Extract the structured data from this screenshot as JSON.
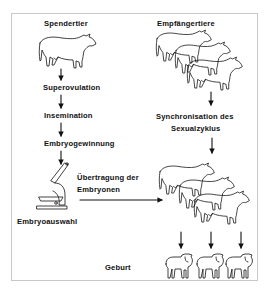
{
  "diagram": {
    "donor_column": {
      "title": "Spendertier",
      "steps": [
        "Superovulation",
        "Insemination",
        "Embryogewinnung"
      ],
      "tool_label": "Embryoauswahl"
    },
    "recipient_column": {
      "title": "Empfängertiere",
      "sync_line1": "Synchronisation des",
      "sync_line2": "Sexualzyklus"
    },
    "transfer": {
      "line1": "Übertragung der",
      "line2": "Embryonen"
    },
    "outcome": {
      "label": "Geburt"
    },
    "icons": {
      "donor": "cow-icon",
      "recipients": "cow-group-icon",
      "selection": "microscope-icon",
      "offspring": "calf-group-icon"
    },
    "colors": {
      "line": "#111111",
      "frame": "#c8c8c8",
      "background": "#ffffff"
    }
  }
}
